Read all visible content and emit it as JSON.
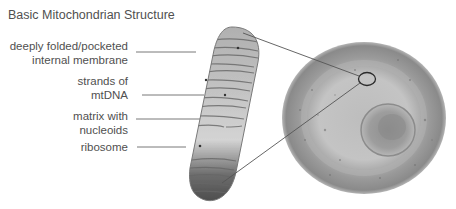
{
  "title": "Basic Mitochondrian Structure",
  "labels": [
    {
      "id": "membrane",
      "text": "deeply folded/pocketed\ninternal membrane"
    },
    {
      "id": "mtdna",
      "text": "strands of\nmtDNA"
    },
    {
      "id": "matrix",
      "text": "matrix with\nnucleoids"
    },
    {
      "id": "ribosome",
      "text": "ribosome"
    }
  ],
  "colors": {
    "text": "#505050",
    "leader_line": "#6a6a6a",
    "membrane_shade": "#5a5a5a",
    "cell_fill": "#a8a8a8"
  },
  "figures": {
    "mitochondrion": "mitochondrion-illustration",
    "cell": "cell-illustration",
    "highlight": "mitochondrion-location-circle"
  }
}
